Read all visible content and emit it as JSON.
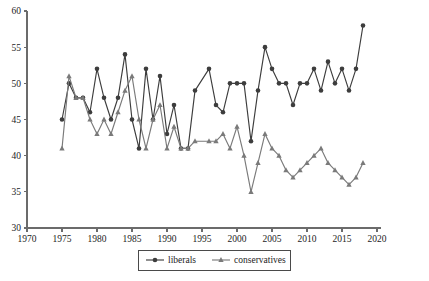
{
  "chart_data": {
    "type": "line",
    "title": "",
    "xlabel": "",
    "ylabel": "",
    "xlim": [
      1970,
      2020
    ],
    "ylim": [
      30,
      60
    ],
    "xticks": [
      1970,
      1975,
      1980,
      1985,
      1990,
      1995,
      2000,
      2005,
      2010,
      2015,
      2020
    ],
    "yticks": [
      30,
      35,
      40,
      45,
      50,
      55,
      60
    ],
    "grid": false,
    "legend_position": "bottom-center",
    "series": [
      {
        "name": "liberals",
        "marker": "circle",
        "color": "#3d3d3d",
        "x": [
          1975,
          1976,
          1977,
          1978,
          1979,
          1980,
          1981,
          1982,
          1983,
          1984,
          1985,
          1986,
          1987,
          1988,
          1989,
          1990,
          1991,
          1992,
          1993,
          1994,
          1996,
          1997,
          1998,
          1999,
          2000,
          2001,
          2002,
          2003,
          2004,
          2005,
          2006,
          2007,
          2008,
          2009,
          2010,
          2011,
          2012,
          2013,
          2014,
          2015,
          2016,
          2017,
          2018
        ],
        "y": [
          45,
          50,
          48,
          48,
          46,
          52,
          48,
          45,
          48,
          54,
          45,
          41,
          52,
          45,
          51,
          43,
          47,
          41,
          41,
          49,
          52,
          47,
          46,
          50,
          50,
          50,
          42,
          49,
          55,
          52,
          50,
          50,
          47,
          50,
          50,
          52,
          49,
          53,
          50,
          52,
          49,
          52,
          58
        ]
      },
      {
        "name": "conservatives",
        "marker": "triangle",
        "color": "#7a7a7a",
        "x": [
          1975,
          1976,
          1977,
          1978,
          1979,
          1980,
          1981,
          1982,
          1983,
          1984,
          1985,
          1986,
          1987,
          1988,
          1989,
          1990,
          1991,
          1992,
          1993,
          1994,
          1996,
          1997,
          1998,
          1999,
          2000,
          2001,
          2002,
          2003,
          2004,
          2005,
          2006,
          2007,
          2008,
          2009,
          2010,
          2011,
          2012,
          2013,
          2014,
          2015,
          2016,
          2017,
          2018
        ],
        "y": [
          41,
          51,
          48,
          48,
          45,
          43,
          45,
          43,
          46,
          49,
          51,
          45,
          41,
          45,
          47,
          41,
          44,
          41,
          41,
          42,
          42,
          42,
          43,
          41,
          44,
          40,
          35,
          39,
          43,
          41,
          40,
          38,
          37,
          38,
          39,
          40,
          41,
          39,
          38,
          37,
          36,
          37,
          39
        ]
      }
    ]
  },
  "legend": {
    "items": [
      {
        "label": "liberals",
        "marker": "circle",
        "color": "#3d3d3d"
      },
      {
        "label": "conservatives",
        "marker": "triangle",
        "color": "#7a7a7a"
      }
    ]
  },
  "axes": {
    "x_tick_labels": [
      "1970",
      "1975",
      "1980",
      "1985",
      "1990",
      "1995",
      "2000",
      "2005",
      "2010",
      "2015",
      "2020"
    ],
    "y_tick_labels": [
      "30",
      "35",
      "40",
      "45",
      "50",
      "55",
      "60"
    ]
  }
}
